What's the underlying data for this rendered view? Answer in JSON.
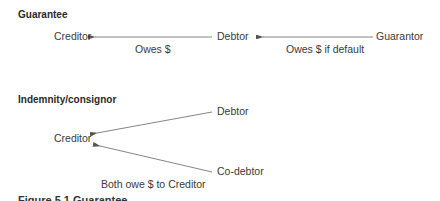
{
  "guarantee": {
    "title": "Guarantee",
    "nodes": {
      "creditor": "Creditor",
      "debtor": "Debtor",
      "guarantor": "Guarantor"
    },
    "edges": [
      {
        "from": "Debtor",
        "to": "Creditor",
        "label": "Owes $"
      },
      {
        "from": "Guarantor",
        "to": "Debtor",
        "label": "Owes $ if default"
      }
    ]
  },
  "indemnity": {
    "title": "Indemnity/consignor",
    "nodes": {
      "creditor": "Creditor",
      "debtor": "Debtor",
      "codebtor": "Co-debtor"
    },
    "edges": [
      {
        "from": "Debtor",
        "to": "Creditor"
      },
      {
        "from": "Co-debtor",
        "to": "Creditor"
      }
    ],
    "label": "Both owe $ to Creditor"
  },
  "caption": "Figure 5.1 Guarantee"
}
